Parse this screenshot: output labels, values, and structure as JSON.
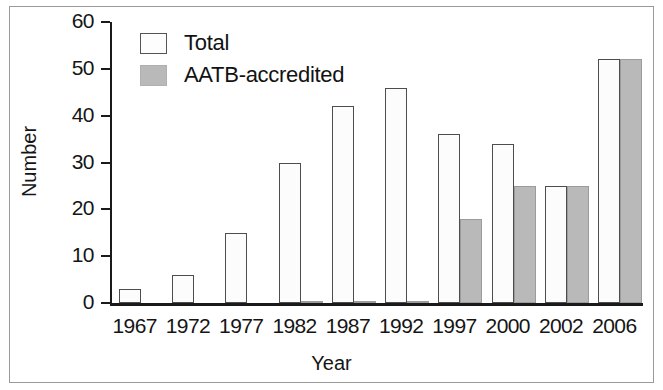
{
  "chart_data": {
    "type": "bar",
    "title": "",
    "subtitle": "",
    "xlabel": "Year",
    "ylabel": "Number",
    "categories": [
      "1967",
      "1972",
      "1977",
      "1982",
      "1987",
      "1992",
      "1997",
      "2000",
      "2002",
      "2006"
    ],
    "series": [
      {
        "name": "Total",
        "color": "#fcfcfc",
        "edge_color": "#4d4d4d",
        "values": [
          3,
          6,
          15,
          30,
          42,
          46,
          36,
          34,
          25,
          52
        ]
      },
      {
        "name": "AATB-accredited",
        "color": "#b9b9b9",
        "edge_color": "#9b9b9b",
        "values": [
          0,
          0,
          0,
          0.5,
          0.5,
          0.5,
          18,
          25,
          25,
          52
        ]
      }
    ],
    "ylim": [
      0,
      60
    ],
    "y_ticks": [
      0,
      10,
      20,
      30,
      40,
      50,
      60
    ],
    "y_tick_labels": [
      "0",
      "10",
      "20",
      "30",
      "40",
      "50",
      "60"
    ],
    "grid": false,
    "legend_position": "upper-left-inside"
  },
  "legend": {
    "entries": [
      {
        "label": "Total"
      },
      {
        "label": "AATB-accredited"
      }
    ]
  },
  "axes": {
    "y_title": "Number",
    "x_title": "Year"
  }
}
